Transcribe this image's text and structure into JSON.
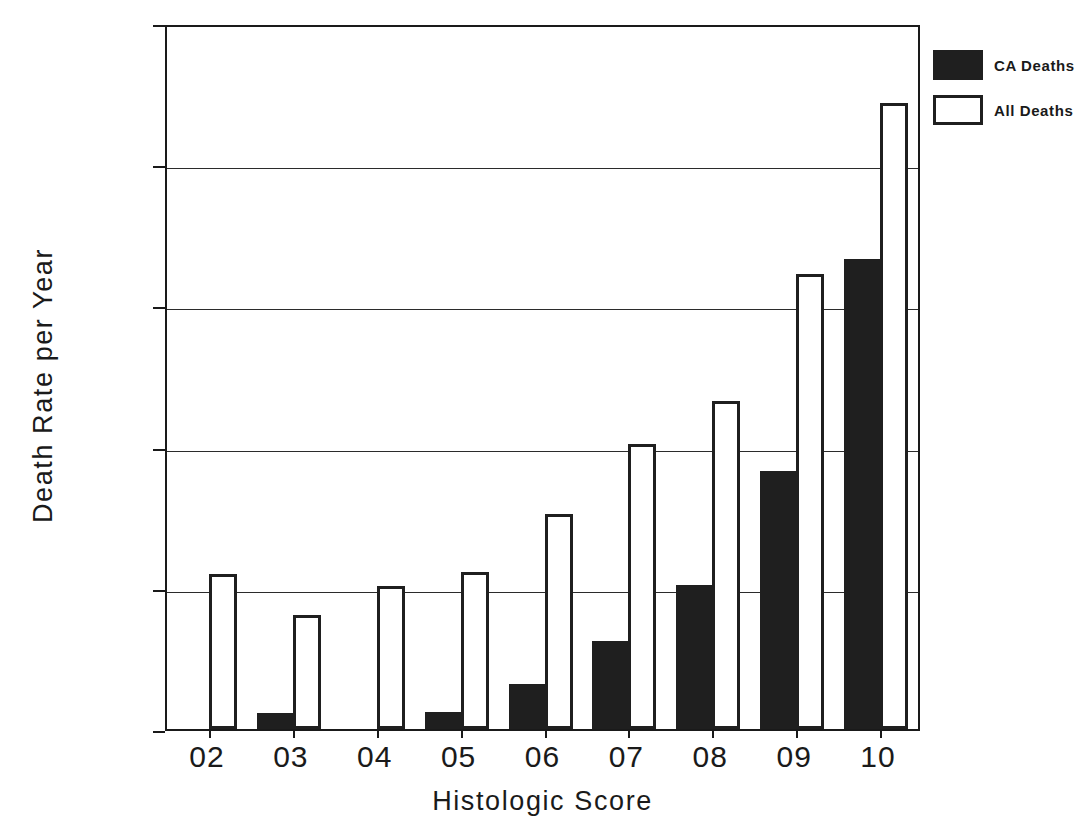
{
  "chart_data": {
    "type": "bar",
    "title": "",
    "xlabel": "Histologic Score",
    "ylabel": "Death Rate per Year",
    "categories": [
      "02",
      "03",
      "04",
      "05",
      "06",
      "07",
      "08",
      "09",
      "10"
    ],
    "series": [
      {
        "name": "CA Deaths",
        "key": "ca",
        "color": "#1f1f1f",
        "fill": "solid",
        "values": [
          0.0,
          0.011,
          0.0,
          0.012,
          0.032,
          0.062,
          0.102,
          0.183,
          0.333
        ]
      },
      {
        "name": "All Deaths",
        "key": "all",
        "color": "#ffffff",
        "fill": "outline",
        "values": [
          0.11,
          0.081,
          0.101,
          0.111,
          0.152,
          0.202,
          0.232,
          0.322,
          0.443
        ]
      }
    ],
    "ylim": [
      0.0,
      0.5
    ],
    "yticks": [
      0.0,
      0.1,
      0.2,
      0.3,
      0.4,
      0.5
    ],
    "ytick_labels": [
      ".00",
      ".10",
      ".20",
      ".30",
      ".40",
      ".50"
    ],
    "grid": "horizontal",
    "legend_position": "top-right"
  },
  "legend": {
    "entries": [
      {
        "label": "CA Deaths",
        "style": "solid"
      },
      {
        "label": "All Deaths",
        "style": "outline"
      }
    ]
  }
}
